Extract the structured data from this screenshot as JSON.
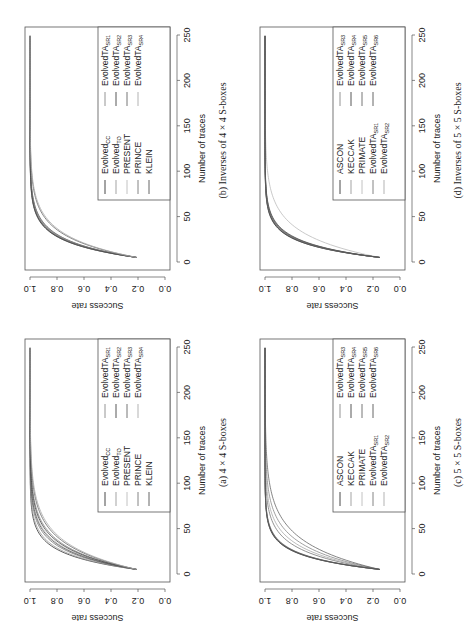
{
  "figure": {
    "orientation": "rotated 90 degrees counter-clockwise"
  },
  "chart_data": [
    {
      "id": "a",
      "type": "line",
      "caption": "(a) 4 × 4 S-boxes",
      "xlabel": "Number of traces",
      "ylabel": "Success rate",
      "xlim": [
        0,
        250
      ],
      "ylim": [
        0.0,
        1.0
      ],
      "xticks": [
        "0",
        "50",
        "100",
        "150",
        "200",
        "250"
      ],
      "yticks": [
        "0.0",
        "0.2",
        "0.4",
        "0.6",
        "0.8",
        "1.0"
      ],
      "grid": false,
      "legend_position": "bottom-right",
      "x_start": 5,
      "x_end": 250,
      "series": [
        {
          "name": "Evolved",
          "sub": "CC",
          "color": "#333333",
          "start": 0.21,
          "rate": 0.062
        },
        {
          "name": "Evolved",
          "sub": "TO",
          "color": "#999999",
          "start": 0.21,
          "rate": 0.058
        },
        {
          "name": "PRESENT",
          "sub": "",
          "color": "#bbbbbb",
          "start": 0.21,
          "rate": 0.047
        },
        {
          "name": "PRINCE",
          "sub": "",
          "color": "#777777",
          "start": 0.21,
          "rate": 0.052
        },
        {
          "name": "KLEIN",
          "sub": "",
          "color": "#555555",
          "start": 0.21,
          "rate": 0.049
        },
        {
          "name": "EvolvedTA",
          "sub": "SR1",
          "color": "#888888",
          "start": 0.21,
          "rate": 0.042
        },
        {
          "name": "EvolvedTA",
          "sub": "SR2",
          "color": "#444444",
          "start": 0.21,
          "rate": 0.044
        },
        {
          "name": "EvolvedTA",
          "sub": "SR3",
          "color": "#666666",
          "start": 0.21,
          "rate": 0.038
        },
        {
          "name": "EvolvedTA",
          "sub": "SR4",
          "color": "#aaaaaa",
          "start": 0.21,
          "rate": 0.036
        }
      ]
    },
    {
      "id": "b",
      "type": "line",
      "caption": "(b) Inverses of 4 × 4 S-boxes",
      "xlabel": "Number of traces",
      "ylabel": "Success rate",
      "xlim": [
        0,
        250
      ],
      "ylim": [
        0.0,
        1.0
      ],
      "xticks": [
        "0",
        "50",
        "100",
        "150",
        "200",
        "250"
      ],
      "yticks": [
        "0.0",
        "0.2",
        "0.4",
        "0.6",
        "0.8",
        "1.0"
      ],
      "grid": false,
      "legend_position": "bottom-right",
      "x_start": 5,
      "x_end": 250,
      "series": [
        {
          "name": "Evolved",
          "sub": "CC",
          "color": "#333333",
          "start": 0.21,
          "rate": 0.06
        },
        {
          "name": "Evolved",
          "sub": "TO",
          "color": "#999999",
          "start": 0.21,
          "rate": 0.058
        },
        {
          "name": "PRESENT",
          "sub": "",
          "color": "#bbbbbb",
          "start": 0.21,
          "rate": 0.056
        },
        {
          "name": "PRINCE",
          "sub": "",
          "color": "#777777",
          "start": 0.21,
          "rate": 0.057
        },
        {
          "name": "KLEIN",
          "sub": "",
          "color": "#555555",
          "start": 0.21,
          "rate": 0.054
        },
        {
          "name": "EvolvedTA",
          "sub": "SR1",
          "color": "#888888",
          "start": 0.21,
          "rate": 0.055
        },
        {
          "name": "EvolvedTA",
          "sub": "SR2",
          "color": "#444444",
          "start": 0.21,
          "rate": 0.059
        },
        {
          "name": "EvolvedTA",
          "sub": "SR3",
          "color": "#666666",
          "start": 0.21,
          "rate": 0.045
        },
        {
          "name": "EvolvedTA",
          "sub": "SR4",
          "color": "#aaaaaa",
          "start": 0.21,
          "rate": 0.043
        }
      ]
    },
    {
      "id": "c",
      "type": "line",
      "caption": "(c) 5 × 5 S-boxes",
      "xlabel": "Number of traces",
      "ylabel": "Success rate",
      "xlim": [
        0,
        250
      ],
      "ylim": [
        0.0,
        1.0
      ],
      "xticks": [
        "0",
        "50",
        "100",
        "150",
        "200",
        "250"
      ],
      "yticks": [
        "0.0",
        "0.2",
        "0.4",
        "0.6",
        "0.8",
        "1.0"
      ],
      "grid": false,
      "legend_position": "bottom-right",
      "x_start": 5,
      "x_end": 250,
      "series": [
        {
          "name": "ASCON",
          "sub": "",
          "color": "#333333",
          "start": 0.15,
          "rate": 0.07
        },
        {
          "name": "KECCAK",
          "sub": "",
          "color": "#999999",
          "start": 0.15,
          "rate": 0.068
        },
        {
          "name": "PRIMATE",
          "sub": "",
          "color": "#bbbbbb",
          "start": 0.15,
          "rate": 0.066
        },
        {
          "name": "EvolvedTA",
          "sub": "SR1",
          "color": "#777777",
          "start": 0.15,
          "rate": 0.052
        },
        {
          "name": "EvolvedTA",
          "sub": "SR2",
          "color": "#aaaaaa",
          "start": 0.15,
          "rate": 0.046
        },
        {
          "name": "EvolvedTA",
          "sub": "SR3",
          "color": "#888888",
          "start": 0.15,
          "rate": 0.04
        },
        {
          "name": "EvolvedTA",
          "sub": "SR4",
          "color": "#444444",
          "start": 0.15,
          "rate": 0.069
        },
        {
          "name": "EvolvedTA",
          "sub": "SR5",
          "color": "#666666",
          "start": 0.15,
          "rate": 0.034
        },
        {
          "name": "EvolvedTA",
          "sub": "SR6",
          "color": "#555555",
          "start": 0.15,
          "rate": 0.067
        }
      ]
    },
    {
      "id": "d",
      "type": "line",
      "caption": "(d) Inverses of 5 × 5 S-boxes",
      "xlabel": "Number of traces",
      "ylabel": "Success rate",
      "xlim": [
        0,
        250
      ],
      "ylim": [
        0.0,
        1.0
      ],
      "xticks": [
        "0",
        "50",
        "100",
        "150",
        "200",
        "250"
      ],
      "yticks": [
        "0.0",
        "0.2",
        "0.4",
        "0.6",
        "0.8",
        "1.0"
      ],
      "grid": false,
      "legend_position": "bottom-right",
      "x_start": 5,
      "x_end": 250,
      "series": [
        {
          "name": "ASCON",
          "sub": "",
          "color": "#333333",
          "start": 0.15,
          "rate": 0.068
        },
        {
          "name": "KECCAK",
          "sub": "",
          "color": "#999999",
          "start": 0.15,
          "rate": 0.066
        },
        {
          "name": "PRIMATE",
          "sub": "",
          "color": "#bbbbbb",
          "start": 0.15,
          "rate": 0.04
        },
        {
          "name": "EvolvedTA",
          "sub": "SR1",
          "color": "#777777",
          "start": 0.15,
          "rate": 0.064
        },
        {
          "name": "EvolvedTA",
          "sub": "SR2",
          "color": "#aaaaaa",
          "start": 0.15,
          "rate": 0.062
        },
        {
          "name": "EvolvedTA",
          "sub": "SR3",
          "color": "#888888",
          "start": 0.15,
          "rate": 0.065
        },
        {
          "name": "EvolvedTA",
          "sub": "SR4",
          "color": "#444444",
          "start": 0.15,
          "rate": 0.067
        },
        {
          "name": "EvolvedTA",
          "sub": "SR5",
          "color": "#666666",
          "start": 0.15,
          "rate": 0.063
        },
        {
          "name": "EvolvedTA",
          "sub": "SR6",
          "color": "#555555",
          "start": 0.15,
          "rate": 0.061
        }
      ]
    }
  ]
}
